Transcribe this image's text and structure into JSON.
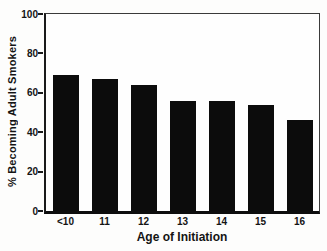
{
  "chart_data": {
    "type": "bar",
    "categories": [
      "<10",
      "11",
      "12",
      "13",
      "14",
      "15",
      "16"
    ],
    "values": [
      69,
      67,
      64,
      56,
      56,
      54,
      46
    ],
    "title": "",
    "xlabel": "Age of Initiation",
    "ylabel": "% Becoming Adult Smokers",
    "ylim": [
      0,
      100
    ],
    "yticks": [
      0,
      20,
      40,
      60,
      80,
      100
    ],
    "grid": false,
    "legend": null,
    "bar_color": "#0c0c0c",
    "axis_color": "#1a1a1a",
    "text_color": "#141414",
    "background_color": "#fdfdfc"
  }
}
